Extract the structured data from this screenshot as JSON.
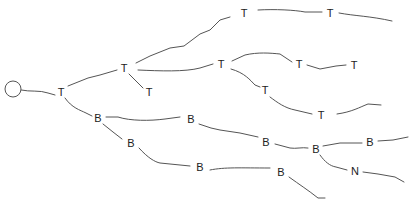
{
  "diagram": {
    "type": "tree",
    "root": {
      "id": "root",
      "shape": "circle",
      "x": 13,
      "y": 89,
      "r": 8
    },
    "nodes": [
      {
        "id": "n1",
        "label": "T",
        "x": 61,
        "y": 92
      },
      {
        "id": "n2",
        "label": "T",
        "x": 124,
        "y": 68
      },
      {
        "id": "n3",
        "label": "T",
        "x": 149,
        "y": 92
      },
      {
        "id": "n4",
        "label": "T",
        "x": 244,
        "y": 13
      },
      {
        "id": "n5",
        "label": "T",
        "x": 330,
        "y": 13
      },
      {
        "id": "n6",
        "label": "T",
        "x": 221,
        "y": 64
      },
      {
        "id": "n7",
        "label": "T",
        "x": 299,
        "y": 64
      },
      {
        "id": "n8",
        "label": "T",
        "x": 354,
        "y": 65
      },
      {
        "id": "n9",
        "label": "T",
        "x": 265,
        "y": 90
      },
      {
        "id": "n10",
        "label": "T",
        "x": 321,
        "y": 115
      },
      {
        "id": "n11",
        "label": "B",
        "x": 98,
        "y": 118
      },
      {
        "id": "n12",
        "label": "B",
        "x": 191,
        "y": 119
      },
      {
        "id": "n13",
        "label": "B",
        "x": 131,
        "y": 143
      },
      {
        "id": "n14",
        "label": "B",
        "x": 200,
        "y": 167
      },
      {
        "id": "n15",
        "label": "B",
        "x": 266,
        "y": 142
      },
      {
        "id": "n16",
        "label": "B",
        "x": 316,
        "y": 149
      },
      {
        "id": "n17",
        "label": "B",
        "x": 370,
        "y": 142
      },
      {
        "id": "n18",
        "label": "B",
        "x": 281,
        "y": 172
      },
      {
        "id": "n19",
        "label": "N",
        "x": 355,
        "y": 171
      }
    ],
    "edges": [
      {
        "id": "e-root-n1",
        "path": "M21,90 C30,92 40,90 48,93 L55,95"
      },
      {
        "id": "e-n1-n2",
        "path": "M68,86 L88,78 L100,75 L117,70"
      },
      {
        "id": "e-n1-n11",
        "path": "M65,98 C72,108 80,110 86,113 L92,116"
      },
      {
        "id": "e-n2-n3",
        "path": "M129,74 L137,82 L143,88"
      },
      {
        "id": "e-n2-n4",
        "path": "M136,63 L150,56 L170,48 L184,46 L200,34 L210,30 L220,20 L230,17"
      },
      {
        "id": "e-n2-n6",
        "path": "M138,70 C160,71 185,72 200,68 L213,64"
      },
      {
        "id": "e-n4-n5",
        "path": "M258,10 C275,9 295,10 305,12 L322,12"
      },
      {
        "id": "e-n5-n-end1",
        "path": "M339,13 C355,16 370,16 392,21"
      },
      {
        "id": "e-n6-n7",
        "path": "M232,61 L245,55 C258,52 270,53 280,54 L292,62"
      },
      {
        "id": "e-n6-n9",
        "path": "M231,69 C245,73 250,80 255,85 L260,87"
      },
      {
        "id": "e-n7-n8",
        "path": "M307,65 L320,69 L336,66 L346,65"
      },
      {
        "id": "e-n9-n10",
        "path": "M270,97 C278,103 285,108 295,110 L312,114"
      },
      {
        "id": "e-n10-end",
        "path": "M337,114 C352,112 360,107 368,104 L381,105"
      },
      {
        "id": "e-n11-n12",
        "path": "M106,117 L118,117 C130,121 150,121 165,119 L180,117"
      },
      {
        "id": "e-n11-n13",
        "path": "M103,124 L113,132 L122,139"
      },
      {
        "id": "e-n12-n15",
        "path": "M199,124 L211,128 L220,130 L240,133 L258,137"
      },
      {
        "id": "e-n13-n14",
        "path": "M139,148 C148,158 155,162 160,163 L190,166"
      },
      {
        "id": "e-n14-n18",
        "path": "M210,170 C225,167 240,168 270,168"
      },
      {
        "id": "e-n15-n16",
        "path": "M275,144 L290,148 C296,149 302,147 308,148"
      },
      {
        "id": "e-n16-n17",
        "path": "M323,146 L340,143 L355,143 L362,143"
      },
      {
        "id": "e-n16-n19",
        "path": "M320,155 C325,162 330,166 336,167 L347,170"
      },
      {
        "id": "e-n17-end",
        "path": "M378,141 L393,140 L408,137"
      },
      {
        "id": "e-n18-end",
        "path": "M289,177 C300,185 308,190 318,198 L325,198"
      },
      {
        "id": "e-n19-end",
        "path": "M363,172 L378,174 L395,177 L404,182"
      }
    ]
  }
}
